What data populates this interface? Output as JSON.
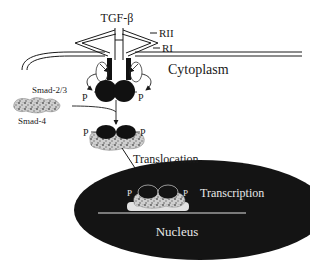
{
  "diagram": {
    "labels": {
      "ligand": "TGF-β",
      "receptor_2": "RII",
      "receptor_1": "RI",
      "compartment_cytoplasm": "Cytoplasm",
      "smad_23": "Smad-2/3",
      "smad_4": "Smad-4",
      "phospho_left": "P",
      "phospho_right": "P",
      "complex_phospho_left": "P",
      "complex_phospho_right": "P",
      "step_translocation": "Translocation",
      "nuclear_phospho_left": "P",
      "nuclear_phospho_right": "P",
      "step_transcription": "Transcription",
      "compartment_nucleus": "Nucleus"
    },
    "colors": {
      "ink": "#1a1a1a",
      "nucleus_fill": "#141414",
      "nucleus_text": "#e8e8e8",
      "smad4_texture": "#8a8a8a",
      "background": "#ffffff"
    }
  }
}
